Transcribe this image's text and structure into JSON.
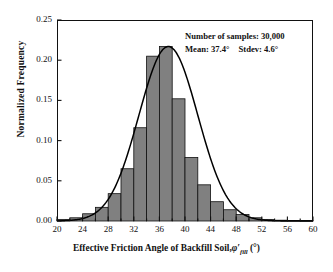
{
  "chart_data": {
    "type": "bar",
    "title": "",
    "subtitle": "",
    "xlabel": "Effective Friction Angle of Backfill Soil, φ′fill (°)",
    "xlabel_parts": {
      "text": "Effective Friction Angle of Backfill Soil,",
      "symbol": "φ′",
      "subscript": "fill",
      "unit": "(°)"
    },
    "ylabel": "Normalized  Frequency",
    "xlim": [
      20,
      60
    ],
    "ylim": [
      0.0,
      0.25
    ],
    "xticks": [
      20,
      24,
      28,
      32,
      36,
      40,
      44,
      48,
      52,
      56,
      60
    ],
    "xtick_labels": [
      "20",
      "24",
      "28",
      "32",
      "36",
      "40",
      "44",
      "48",
      "52",
      "56",
      "60"
    ],
    "yticks": [
      0.0,
      0.05,
      0.1,
      0.15,
      0.2,
      0.25
    ],
    "ytick_labels": [
      "0.00",
      "0.05",
      "0.10",
      "0.15",
      "0.20",
      "0.25"
    ],
    "grid": false,
    "legend": null,
    "bin_width": 2,
    "bar_color": "#808080",
    "bar_edge_color": "#111111",
    "curve_color": "#000000",
    "categories": [
      21,
      23,
      25,
      27,
      29,
      31,
      33,
      35,
      37,
      39,
      41,
      43,
      45,
      47,
      49,
      51,
      53,
      55,
      57,
      59
    ],
    "bin_edges": [
      20,
      22,
      24,
      26,
      28,
      30,
      32,
      34,
      36,
      38,
      40,
      42,
      44,
      46,
      48,
      50,
      52,
      54,
      56,
      58,
      60
    ],
    "values": [
      0.002,
      0.004,
      0.009,
      0.017,
      0.034,
      0.065,
      0.116,
      0.205,
      0.217,
      0.152,
      0.079,
      0.045,
      0.024,
      0.014,
      0.008,
      0.004,
      0.002,
      0.001,
      0.0005,
      0.0003
    ],
    "series": [
      {
        "name": "Normalized Frequency",
        "type": "bar",
        "values": [
          0.002,
          0.004,
          0.009,
          0.017,
          0.034,
          0.065,
          0.116,
          0.205,
          0.217,
          0.152,
          0.079,
          0.045,
          0.024,
          0.014,
          0.008,
          0.004,
          0.002,
          0.001,
          0.0005,
          0.0003
        ]
      },
      {
        "name": "Fitted normal distribution",
        "type": "line",
        "mean": 37.4,
        "stdev": 4.6,
        "peak": 0.217
      }
    ],
    "annotations": [
      "Number of samples: 30,000",
      "Mean: 37.4°   Stdev: 4.6°"
    ]
  },
  "annotation": {
    "samples_line": "Number of samples: 30,000",
    "mean_label": "Mean: 37.4°",
    "stdev_label": "Stdev: 4.6°"
  }
}
